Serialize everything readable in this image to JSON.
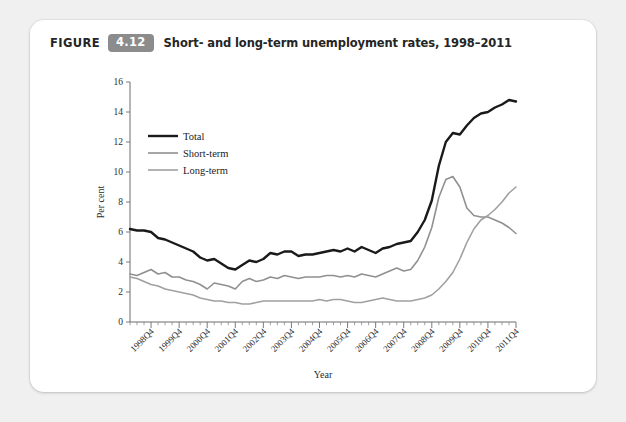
{
  "figure": {
    "label": "FIGURE",
    "number": "4.12",
    "caption": "Short- and long-term unemployment rates, 1998–2011"
  },
  "chart_data": {
    "type": "line",
    "title": "Short- and long-term unemployment rates, 1998–2011",
    "xlabel": "Year",
    "ylabel": "Per cent",
    "ylim": [
      0,
      16
    ],
    "yticks": [
      0,
      2,
      4,
      6,
      8,
      10,
      12,
      14,
      16
    ],
    "grid": false,
    "legend_position": "top-left",
    "x_tick_labels": [
      "1998Q4",
      "1999Q4",
      "2000Q4",
      "2001Q4",
      "2002Q4",
      "2003Q4",
      "2004Q4",
      "2005Q4",
      "2006Q4",
      "2007Q4",
      "2008Q4",
      "2009Q4",
      "2010Q4",
      "2011Q4"
    ],
    "x": [
      "1998Q1",
      "1998Q2",
      "1998Q3",
      "1998Q4",
      "1999Q1",
      "1999Q2",
      "1999Q3",
      "1999Q4",
      "2000Q1",
      "2000Q2",
      "2000Q3",
      "2000Q4",
      "2001Q1",
      "2001Q2",
      "2001Q3",
      "2001Q4",
      "2002Q1",
      "2002Q2",
      "2002Q3",
      "2002Q4",
      "2003Q1",
      "2003Q2",
      "2003Q3",
      "2003Q4",
      "2004Q1",
      "2004Q2",
      "2004Q3",
      "2004Q4",
      "2005Q1",
      "2005Q2",
      "2005Q3",
      "2005Q4",
      "2006Q1",
      "2006Q2",
      "2006Q3",
      "2006Q4",
      "2007Q1",
      "2007Q2",
      "2007Q3",
      "2007Q4",
      "2008Q1",
      "2008Q2",
      "2008Q3",
      "2008Q4",
      "2009Q1",
      "2009Q2",
      "2009Q3",
      "2009Q4",
      "2010Q1",
      "2010Q2",
      "2010Q3",
      "2010Q4",
      "2011Q1",
      "2011Q2",
      "2011Q3",
      "2011Q4"
    ],
    "series": [
      {
        "name": "Total",
        "color": "#1a1a1a",
        "width": 2.4,
        "values": [
          6.2,
          6.1,
          6.1,
          6.0,
          5.6,
          5.5,
          5.3,
          5.1,
          4.9,
          4.7,
          4.3,
          4.1,
          4.2,
          3.9,
          3.6,
          3.5,
          3.8,
          4.1,
          4.0,
          4.2,
          4.6,
          4.5,
          4.7,
          4.7,
          4.4,
          4.5,
          4.5,
          4.6,
          4.7,
          4.8,
          4.7,
          4.9,
          4.7,
          5.0,
          4.8,
          4.6,
          4.9,
          5.0,
          5.2,
          5.3,
          5.4,
          6.0,
          6.8,
          8.1,
          10.4,
          12.0,
          12.6,
          12.5,
          13.1,
          13.6,
          13.9,
          14.0,
          14.3,
          14.5,
          14.8,
          14.7
        ]
      },
      {
        "name": "Short-term",
        "color": "#909090",
        "width": 1.6,
        "values": [
          3.2,
          3.1,
          3.3,
          3.5,
          3.2,
          3.3,
          3.0,
          3.0,
          2.8,
          2.7,
          2.5,
          2.2,
          2.6,
          2.5,
          2.4,
          2.2,
          2.7,
          2.9,
          2.7,
          2.8,
          3.0,
          2.9,
          3.1,
          3.0,
          2.9,
          3.0,
          3.0,
          3.0,
          3.1,
          3.1,
          3.0,
          3.1,
          3.0,
          3.2,
          3.1,
          3.0,
          3.2,
          3.4,
          3.6,
          3.4,
          3.5,
          4.1,
          5.0,
          6.3,
          8.3,
          9.5,
          9.7,
          9.0,
          7.6,
          7.1,
          7.0,
          7.0,
          6.8,
          6.6,
          6.3,
          5.9
        ]
      },
      {
        "name": "Long-term",
        "color": "#a0a0a0",
        "width": 1.6,
        "values": [
          3.0,
          2.9,
          2.7,
          2.5,
          2.4,
          2.2,
          2.1,
          2.0,
          1.9,
          1.8,
          1.6,
          1.5,
          1.4,
          1.4,
          1.3,
          1.3,
          1.2,
          1.2,
          1.3,
          1.4,
          1.4,
          1.4,
          1.4,
          1.4,
          1.4,
          1.4,
          1.4,
          1.5,
          1.4,
          1.5,
          1.5,
          1.4,
          1.3,
          1.3,
          1.4,
          1.5,
          1.6,
          1.5,
          1.4,
          1.4,
          1.4,
          1.5,
          1.6,
          1.8,
          2.2,
          2.7,
          3.3,
          4.2,
          5.3,
          6.2,
          6.8,
          7.1,
          7.5,
          8.0,
          8.6,
          9.0
        ]
      }
    ]
  }
}
